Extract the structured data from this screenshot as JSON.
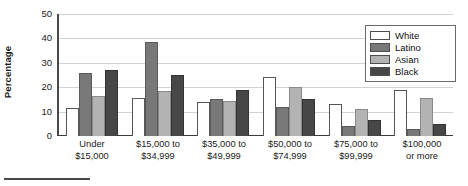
{
  "chart": {
    "ylabel": "Percentage"
  },
  "legend": {
    "position": "top-right",
    "items": [
      {
        "label": "White",
        "color": "#ffffff"
      },
      {
        "label": "Latino",
        "color": "#787878"
      },
      {
        "label": "Asian",
        "color": "#b3b3b3"
      },
      {
        "label": "Black",
        "color": "#474747"
      }
    ]
  },
  "chart_data": {
    "type": "bar",
    "title": "",
    "xlabel": "",
    "ylabel": "Percentage",
    "ylim": [
      0,
      50
    ],
    "yticks": [
      0,
      10,
      20,
      30,
      40,
      50
    ],
    "ytick_labels": [
      "0",
      "10",
      "20",
      "30",
      "40",
      "50"
    ],
    "grid": true,
    "legend_position": "top-right",
    "categories": [
      "Under\n$15,000",
      "$15,000 to\n$34,999",
      "$35,000 to\n$49,999",
      "$50,000 to\n$74,999",
      "$75,000 to\n$99,999",
      "$100,000\nor more"
    ],
    "series": [
      {
        "name": "White",
        "color": "#ffffff",
        "values": [
          11.5,
          15.5,
          14.0,
          24.0,
          13.0,
          19.0
        ]
      },
      {
        "name": "Latino",
        "color": "#787878",
        "values": [
          26.0,
          38.5,
          15.0,
          12.0,
          4.0,
          3.0
        ]
      },
      {
        "name": "Asian",
        "color": "#b3b3b3",
        "values": [
          16.5,
          18.5,
          14.5,
          20.0,
          11.0,
          15.5
        ]
      },
      {
        "name": "Black",
        "color": "#474747",
        "values": [
          27.0,
          25.0,
          19.0,
          15.0,
          6.5,
          5.0
        ]
      }
    ]
  }
}
